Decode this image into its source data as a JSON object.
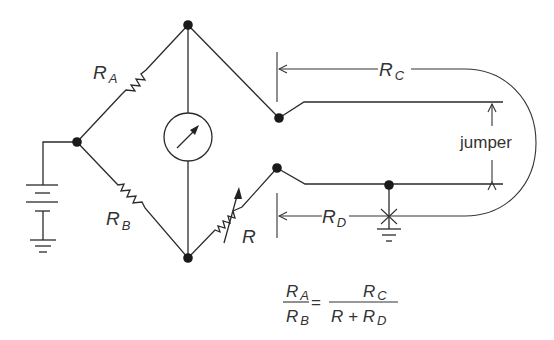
{
  "diagram": {
    "labels": {
      "ra": {
        "main": "R",
        "sub": "A"
      },
      "rb": {
        "main": "R",
        "sub": "B"
      },
      "r": {
        "main": "R"
      },
      "rc": {
        "main": "R",
        "sub": "C"
      },
      "rd": {
        "main": "R",
        "sub": "D"
      },
      "jumper": "jumper"
    },
    "equation": {
      "lhs_num": {
        "main": "R",
        "sub": "A"
      },
      "lhs_den": {
        "main": "R",
        "sub": "B"
      },
      "equals": "=",
      "rhs_num": {
        "main": "R",
        "sub": "C"
      },
      "rhs_den_prefix": "R + R",
      "rhs_den_sub": "D"
    },
    "components": [
      "battery",
      "ground",
      "resistor-ra",
      "resistor-rb",
      "galvanometer",
      "variable-resistor-r",
      "line-pair",
      "jumper",
      "ground-at-junction"
    ],
    "colors": {
      "line": "#2a2a2a",
      "text": "#333333",
      "background": "#ffffff"
    }
  }
}
